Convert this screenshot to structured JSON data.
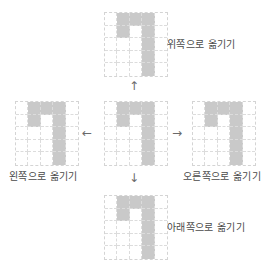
{
  "header": {
    "cut_text": ""
  },
  "shape": {
    "rows": 5,
    "cols": 5,
    "filled": [
      [
        0,
        1
      ],
      [
        0,
        2
      ],
      [
        0,
        3
      ],
      [
        1,
        1
      ],
      [
        1,
        3
      ],
      [
        2,
        3
      ],
      [
        3,
        3
      ],
      [
        4,
        3
      ]
    ],
    "fill_color": "#c9c9c9",
    "grid_line_color": "#d4d4d4"
  },
  "panels": {
    "top": {
      "label": "위쪽으로 옮기기"
    },
    "center": {
      "label": ""
    },
    "left": {
      "label": "왼쪽으로 옮기기"
    },
    "right": {
      "label": "오른쪽으로 옮기기"
    },
    "bottom": {
      "label": "아래쪽으로 옮기기"
    }
  },
  "arrows": {
    "up": "↑",
    "down": "↓",
    "left": "←",
    "right": "→"
  }
}
